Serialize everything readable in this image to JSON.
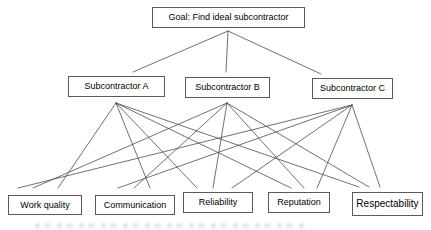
{
  "diagram": {
    "goal": {
      "label": "Goal: Find ideal subcontractor"
    },
    "alternatives": [
      {
        "label": "Subcontractor A"
      },
      {
        "label": "Subcontractor B"
      },
      {
        "label": "Subcontractor C"
      }
    ],
    "criteria": [
      {
        "label": "Work quality"
      },
      {
        "label": "Communication"
      },
      {
        "label": "Reliability"
      },
      {
        "label": "Reputation"
      },
      {
        "label": "Respectability"
      }
    ],
    "edges": [
      {
        "from": "Goal: Find ideal subcontractor",
        "to": "Subcontractor A"
      },
      {
        "from": "Goal: Find ideal subcontractor",
        "to": "Subcontractor B"
      },
      {
        "from": "Goal: Find ideal subcontractor",
        "to": "Subcontractor C"
      },
      {
        "from": "Subcontractor A",
        "to": "Work quality"
      },
      {
        "from": "Subcontractor A",
        "to": "Communication"
      },
      {
        "from": "Subcontractor A",
        "to": "Reliability"
      },
      {
        "from": "Subcontractor A",
        "to": "Reputation"
      },
      {
        "from": "Subcontractor A",
        "to": "Respectability"
      },
      {
        "from": "Subcontractor B",
        "to": "Work quality"
      },
      {
        "from": "Subcontractor B",
        "to": "Communication"
      },
      {
        "from": "Subcontractor B",
        "to": "Reliability"
      },
      {
        "from": "Subcontractor B",
        "to": "Reputation"
      },
      {
        "from": "Subcontractor B",
        "to": "Respectability"
      },
      {
        "from": "Subcontractor C",
        "to": "Work quality"
      },
      {
        "from": "Subcontractor C",
        "to": "Communication"
      },
      {
        "from": "Subcontractor C",
        "to": "Reliability"
      },
      {
        "from": "Subcontractor C",
        "to": "Reputation"
      },
      {
        "from": "Subcontractor C",
        "to": "Respectability"
      }
    ],
    "colors": {
      "background": "#ffffff",
      "box_border": "#595959",
      "line": "#4d4d4d",
      "text": "#000000"
    }
  }
}
